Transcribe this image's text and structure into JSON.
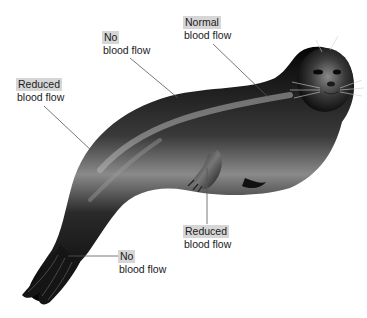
{
  "diagram": {
    "labels": [
      {
        "id": "no-flow-back",
        "highlight": "No",
        "text": "blood flow"
      },
      {
        "id": "normal-flow-neck",
        "highlight": "Normal",
        "text": "blood flow"
      },
      {
        "id": "reduced-flow-side",
        "highlight": "Reduced",
        "text": "blood flow"
      },
      {
        "id": "reduced-flow-flipper",
        "highlight": "Reduced",
        "text": "blood flow"
      },
      {
        "id": "no-flow-tail",
        "highlight": "No",
        "text": "blood flow"
      }
    ],
    "colors": {
      "label_highlight": "#d6d6d6",
      "leader_line": "#555555",
      "body_dark": "#0a0a0a",
      "body_highlight": "#9a9a9a"
    }
  }
}
